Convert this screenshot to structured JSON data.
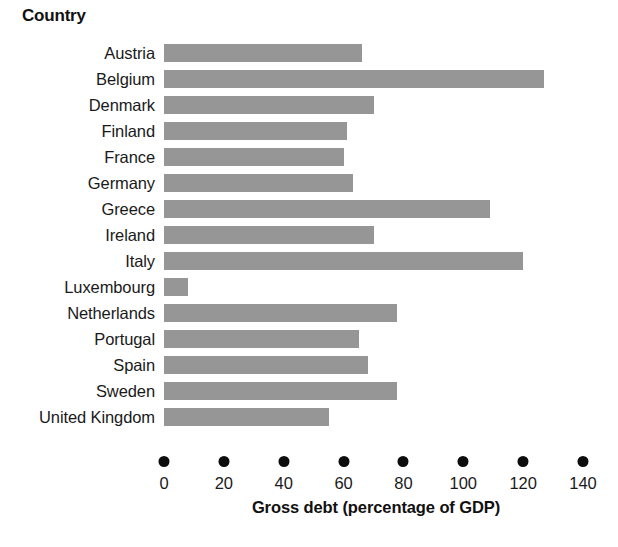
{
  "chart_data": {
    "type": "bar",
    "orientation": "horizontal",
    "title": "Country",
    "xlabel": "Gross debt (percentage of GDP)",
    "ylabel": "Country",
    "categories": [
      "Austria",
      "Belgium",
      "Denmark",
      "Finland",
      "France",
      "Germany",
      "Greece",
      "Ireland",
      "Italy",
      "Luxembourg",
      "Netherlands",
      "Portugal",
      "Spain",
      "Sweden",
      "United Kingdom"
    ],
    "values": [
      66,
      127,
      70,
      61,
      60,
      63,
      109,
      70,
      120,
      8,
      78,
      65,
      68,
      78,
      55
    ],
    "xlim": [
      0,
      140
    ],
    "xticks": [
      0,
      20,
      40,
      60,
      80,
      100,
      120,
      140
    ],
    "xtick_labels": [
      "0",
      "20",
      "40",
      "60",
      "80",
      "100",
      "120",
      "140"
    ],
    "grid": false,
    "legend": null,
    "bar_color": "#969696",
    "axis_marker_style": "filled-circle",
    "axis_marker_color": "#0d0d0d",
    "text_color": "#1a1a1a",
    "background": "#ffffff"
  }
}
